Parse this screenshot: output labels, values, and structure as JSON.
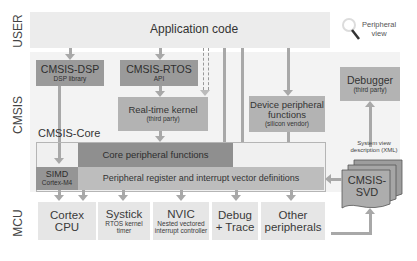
{
  "layers": {
    "user": "USER",
    "cmsis": "CMSIS",
    "mcu": "MCU"
  },
  "application": {
    "title": "Application code"
  },
  "peripheral_view": {
    "icon": "magnifier-icon",
    "label_line1": "Peripheral",
    "label_line2": "view"
  },
  "cmsis_dsp": {
    "title": "CMSIS-DSP",
    "subtitle": "DSP library"
  },
  "cmsis_rtos": {
    "title": "CMSIS-RTOS",
    "subtitle": "API"
  },
  "rtos_kernel": {
    "title": "Real-time kernel",
    "subtitle": "(third party)"
  },
  "device_peripheral": {
    "title_line1": "Device peripheral",
    "title_line2": "functions",
    "subtitle": "(silicon vendor)"
  },
  "debugger": {
    "title": "Debugger",
    "subtitle": "(third party)"
  },
  "cmsis_core": {
    "label": "CMSIS-Core",
    "core_peripheral": "Core peripheral functions",
    "simd_title": "SIMD",
    "simd_subtitle": "Cortex-M4",
    "register_defs": "Peripheral register and interrupt vector definitions"
  },
  "svd": {
    "caption_line1": "System view",
    "caption_line2": "description (XML)",
    "title_line1": "CMSIS-",
    "title_line2": "SVD"
  },
  "mcu_blocks": [
    {
      "title_line1": "Cortex",
      "title_line2": "CPU",
      "subtitle_line1": "",
      "subtitle_line2": ""
    },
    {
      "title_line1": "Systick",
      "title_line2": "",
      "subtitle_line1": "RTOS kernel",
      "subtitle_line2": "timer"
    },
    {
      "title_line1": "NVIC",
      "title_line2": "",
      "subtitle_line1": "Nested vectored",
      "subtitle_line2": "interrupt controller"
    },
    {
      "title_line1": "Debug",
      "title_line2": "+ Trace",
      "subtitle_line1": "",
      "subtitle_line2": ""
    },
    {
      "title_line1": "Other",
      "title_line2": "peripherals",
      "subtitle_line1": "",
      "subtitle_line2": ""
    }
  ],
  "colors": {
    "band": "#ececec",
    "dark_box": "#9a9a9a",
    "mid_box": "#b3b3b3",
    "light_box": "#e6e6e6",
    "connector": "#a8a8a8"
  }
}
